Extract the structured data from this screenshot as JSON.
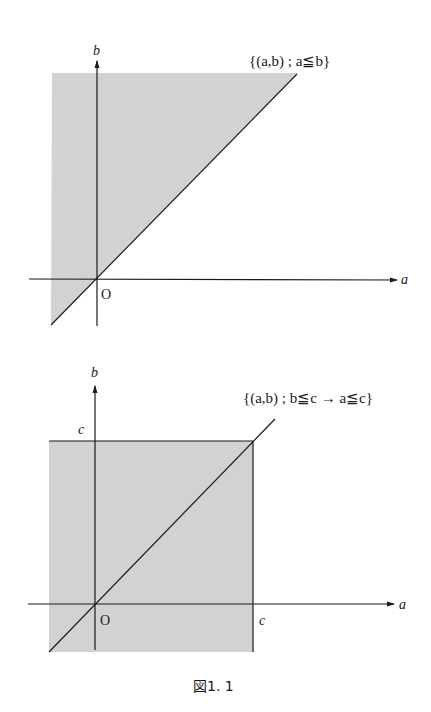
{
  "colors": {
    "shade": "#d2d2d2",
    "line": "#1a1a1a",
    "background": "#ffffff"
  },
  "figure1": {
    "set_label": "{(a,b) ; a≦b}",
    "axis_x_label": "a",
    "axis_y_label": "b",
    "origin_label": "O"
  },
  "figure2": {
    "set_label": "{(a,b) ; b≦c → a≦c}",
    "axis_x_label": "a",
    "axis_y_label": "b",
    "origin_label": "O",
    "c_top_label": "c",
    "c_right_label": "c"
  },
  "caption": "図1. 1"
}
